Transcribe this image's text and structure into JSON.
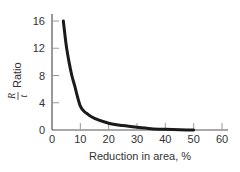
{
  "chart_data": {
    "type": "line",
    "title": "",
    "xlabel": "Reduction in area, %",
    "ylabel": "Ratio",
    "ylabel_fraction": {
      "numerator": "R",
      "denominator": "t"
    },
    "xlim": [
      0,
      60
    ],
    "ylim": [
      0,
      16
    ],
    "xticks": [
      0,
      10,
      20,
      30,
      40,
      50,
      60
    ],
    "yticks": [
      0,
      4,
      8,
      12,
      16
    ],
    "grid": false,
    "legend": null,
    "series": [
      {
        "name": "R/t ratio",
        "x": [
          4,
          5,
          6,
          7,
          8,
          10,
          12,
          15,
          20,
          25,
          30,
          35,
          40,
          45,
          50
        ],
        "y": [
          16,
          12.5,
          10,
          8,
          6.5,
          3.5,
          2.5,
          1.7,
          1.0,
          0.65,
          0.4,
          0.2,
          0.1,
          0.03,
          0
        ]
      }
    ],
    "colors": {
      "line": "#1a1a1a",
      "axis": "#555555"
    }
  }
}
